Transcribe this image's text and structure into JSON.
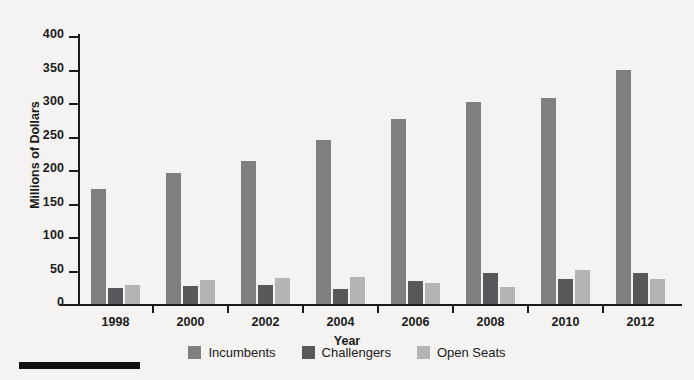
{
  "chart_data": {
    "type": "bar",
    "title": "",
    "xlabel": "Year",
    "ylabel": "Millions of Dollars",
    "categories": [
      "1998",
      "2000",
      "2002",
      "2004",
      "2006",
      "2008",
      "2010",
      "2012"
    ],
    "series": [
      {
        "name": "Incumbents",
        "color": "#7f7f7f",
        "values": [
          172,
          195,
          213,
          245,
          276,
          302,
          308,
          349
        ]
      },
      {
        "name": "Challengers",
        "color": "#58585a",
        "values": [
          24,
          27,
          28,
          22,
          34,
          46,
          38,
          46
        ]
      },
      {
        "name": "Open Seats",
        "color": "#b4b4b4",
        "values": [
          28,
          36,
          39,
          40,
          31,
          25,
          51,
          38
        ]
      }
    ],
    "ylim": [
      0,
      400
    ],
    "yticks": [
      0,
      50,
      100,
      150,
      200,
      250,
      300,
      350,
      400
    ],
    "ytick_labels": [
      "0",
      "50",
      "100",
      "150",
      "200",
      "250",
      "300",
      "350",
      "400"
    ],
    "grid": false,
    "legend_position": "bottom-center"
  },
  "colors": {
    "background": "#f4f3f1",
    "axis": "#1b1b1b",
    "text": "#1b1b1b",
    "footer_rule": "#111111"
  }
}
